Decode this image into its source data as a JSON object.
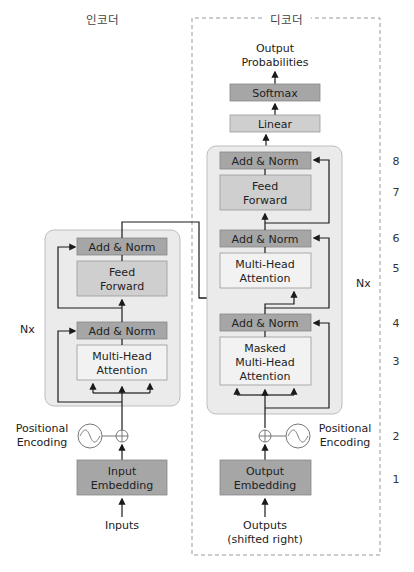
{
  "encoder": {
    "title": "인코더",
    "nx": "Nx",
    "add_norm_top": "Add & Norm",
    "feed_forward": [
      "Feed",
      "Forward"
    ],
    "add_norm_bottom": "Add & Norm",
    "multi_head": [
      "Multi-Head",
      "Attention"
    ],
    "positional_encoding": [
      "Positional",
      "Encoding"
    ],
    "embedding": [
      "Input",
      "Embedding"
    ],
    "input_label": "Inputs"
  },
  "decoder": {
    "title": "디코더",
    "nx": "Nx",
    "output_probabilities": [
      "Output",
      "Probabilities"
    ],
    "softmax": "Softmax",
    "linear": "Linear",
    "add_norm_3": "Add & Norm",
    "feed_forward": [
      "Feed",
      "Forward"
    ],
    "add_norm_2": "Add & Norm",
    "multi_head": [
      "Multi-Head",
      "Attention"
    ],
    "add_norm_1": "Add & Norm",
    "masked_multi_head": [
      "Masked",
      "Multi-Head",
      "Attention"
    ],
    "positional_encoding": [
      "Positional",
      "Encoding"
    ],
    "embedding": [
      "Output",
      "Embedding"
    ],
    "output_label": [
      "Outputs",
      "(shifted right)"
    ]
  },
  "step_numbers": [
    "8",
    "7",
    "6",
    "5",
    "4",
    "3",
    "2",
    "1"
  ],
  "colors": {
    "block_bg": "#ebebeb",
    "dark_box": "#a6a6a6",
    "mid_box": "#cfcfcf",
    "light_box": "#f2f2f2",
    "line": "#1a1a1a",
    "dashed": "#9a9a9a"
  }
}
